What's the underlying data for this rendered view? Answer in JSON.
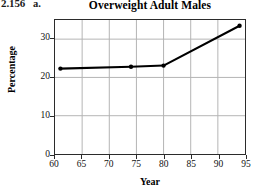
{
  "problem": {
    "number": "2.156",
    "part": "a."
  },
  "chart_data": {
    "type": "line",
    "title": "Overweight Adult Males",
    "xlabel": "Year",
    "ylabel": "Percentage",
    "xlim": [
      60,
      95
    ],
    "ylim": [
      0,
      35
    ],
    "xticks": [
      60,
      65,
      70,
      75,
      80,
      85,
      90,
      95
    ],
    "xtick_labels": [
      "60",
      "65",
      "70",
      "75",
      "80",
      "85",
      "90",
      "95"
    ],
    "yticks": [
      0,
      10,
      20,
      30
    ],
    "ytick_labels": [
      "0",
      "10",
      "20",
      "30"
    ],
    "grid": true,
    "legend": false,
    "marker": "filled-circle",
    "line_color": "#000000",
    "grid_color": "#b4b4b4",
    "frame_color": "#2b2b2b",
    "x": [
      61,
      74,
      80,
      94
    ],
    "y": [
      22.3,
      22.8,
      23.1,
      33.5
    ],
    "points": [
      {
        "x": 61,
        "y": 22.3
      },
      {
        "x": 74,
        "y": 22.8
      },
      {
        "x": 80,
        "y": 23.1
      },
      {
        "x": 94,
        "y": 33.5
      }
    ]
  }
}
